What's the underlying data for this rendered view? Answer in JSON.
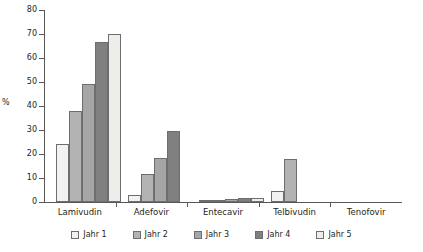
{
  "chart_data": {
    "type": "bar",
    "title": "",
    "xlabel": "",
    "ylabel": "%",
    "ylim": [
      0,
      80
    ],
    "yticks": [
      "0",
      "10",
      "20",
      "30",
      "40",
      "50",
      "60",
      "70",
      "80"
    ],
    "grid": false,
    "legend_position": "bottom",
    "categories": [
      "Lamivudin",
      "Adefovir",
      "Entecavir",
      "Telbivudin",
      "Tenofovir"
    ],
    "series": [
      {
        "name": "Jahr 1",
        "color": "#f2f2f0",
        "values": [
          24,
          3,
          0.5,
          4.5,
          0
        ]
      },
      {
        "name": "Jahr 2",
        "color": "#b3b3b3",
        "values": [
          38,
          11.5,
          1,
          18,
          0
        ]
      },
      {
        "name": "Jahr 3",
        "color": "#a6a6a6",
        "values": [
          49,
          18.5,
          1.3,
          0,
          0
        ]
      },
      {
        "name": "Jahr 4",
        "color": "#808080",
        "values": [
          66.5,
          29.5,
          1.5,
          0,
          0
        ]
      },
      {
        "name": "Jahr 5",
        "color": "#ededea",
        "values": [
          70,
          0,
          1.5,
          0,
          0
        ]
      }
    ]
  },
  "axis": {
    "y_title": "%"
  },
  "legend": {
    "items": [
      {
        "label": "Jahr 1"
      },
      {
        "label": "Jahr 2"
      },
      {
        "label": "Jahr 3"
      },
      {
        "label": "Jahr 4"
      },
      {
        "label": "Jahr 5"
      }
    ]
  }
}
